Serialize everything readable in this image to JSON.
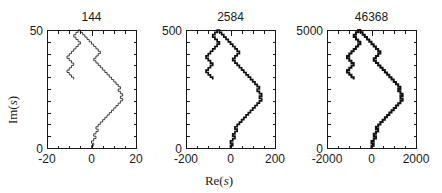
{
  "figure": {
    "background_color": "#ffffff",
    "ink_color": "#1a1a1a",
    "line_color": "#111111",
    "xlabel_main": "Re(",
    "xlabel_var": "s",
    "xlabel_close": ")",
    "ylabel_main": "Im(",
    "ylabel_var": "s",
    "ylabel_close": ")"
  },
  "chart_data": {
    "type": "line",
    "title": "",
    "xlabel": "Re(s)",
    "ylabel": "Im(s)",
    "grid": false,
    "legend": "none",
    "panels": [
      {
        "title": "144",
        "n_steps": 144,
        "xlim": [
          -20,
          20
        ],
        "ylim": [
          0,
          50
        ],
        "xticks": [
          -20,
          0,
          20
        ],
        "xticklabels": [
          "-20",
          "0",
          "20"
        ],
        "yticks": [
          0,
          50
        ],
        "yticklabels": [
          "0",
          "50"
        ],
        "x_minor_tick_count": 8,
        "y_minor_tick_count": 10,
        "line_width": 0.8,
        "walk": {
          "x": [
            0,
            0,
            1,
            1,
            0,
            0,
            1,
            1,
            2,
            2,
            1,
            1,
            2,
            2,
            3,
            3,
            2,
            2,
            3,
            3,
            4,
            4,
            5,
            5,
            6,
            6,
            7,
            7,
            8,
            8,
            9,
            9,
            10,
            10,
            11,
            11,
            12,
            12,
            13,
            13,
            14,
            14,
            13,
            13,
            14,
            14,
            13,
            13,
            12,
            12,
            13,
            13,
            12,
            12,
            11,
            11,
            10,
            10,
            9,
            9,
            8,
            8,
            7,
            7,
            6,
            6,
            5,
            5,
            4,
            4,
            3,
            3,
            2,
            2,
            1,
            1,
            2,
            2,
            3,
            3,
            4,
            4,
            3,
            3,
            2,
            2,
            1,
            1,
            0,
            0,
            -1,
            -1,
            -2,
            -2,
            -3,
            -3,
            -4,
            -4,
            -5,
            -5,
            -6,
            -6,
            -7,
            -7,
            -8,
            -8,
            -7,
            -7,
            -6,
            -6,
            -5,
            -5,
            -6,
            -6,
            -7,
            -7,
            -8,
            -8,
            -9,
            -9,
            -10,
            -10,
            -11,
            -11,
            -10,
            -10,
            -9,
            -9,
            -8,
            -8,
            -9,
            -9,
            -10,
            -10,
            -11,
            -11,
            -10,
            -10,
            -9,
            -9,
            -8,
            -8,
            -7,
            -7,
            -6,
            -6
          ],
          "y": [
            0,
            1,
            1,
            2,
            2,
            3,
            3,
            4,
            4,
            5,
            5,
            6,
            6,
            7,
            7,
            8,
            8,
            9,
            9,
            10,
            10,
            11,
            11,
            12,
            12,
            13,
            13,
            14,
            14,
            15,
            15,
            16,
            16,
            17,
            17,
            18,
            18,
            19,
            19,
            20,
            20,
            21,
            21,
            22,
            22,
            23,
            23,
            24,
            24,
            25,
            25,
            26,
            26,
            27,
            27,
            28,
            28,
            29,
            29,
            30,
            30,
            31,
            31,
            32,
            32,
            33,
            33,
            34,
            34,
            35,
            35,
            36,
            36,
            37,
            37,
            38,
            38,
            39,
            39,
            40,
            40,
            41,
            41,
            42,
            42,
            43,
            43,
            44,
            44,
            45,
            45,
            46,
            46,
            47,
            47,
            48,
            48,
            49,
            49,
            50,
            50,
            49,
            49,
            48,
            48,
            47,
            47,
            46,
            46,
            45,
            45,
            44,
            44,
            43,
            43,
            42,
            42,
            41,
            41,
            40,
            40,
            39,
            39,
            38,
            38,
            37,
            37,
            36,
            36,
            35,
            35,
            34,
            34,
            33,
            33,
            32,
            32,
            31,
            31,
            30,
            30,
            29
          ]
        }
      },
      {
        "title": "2584",
        "n_steps": 2584,
        "xlim": [
          -200,
          200
        ],
        "ylim": [
          0,
          500
        ],
        "xticks": [
          -200,
          0,
          200
        ],
        "xticklabels": [
          "-200",
          "0",
          "200"
        ],
        "yticks": [
          0,
          500
        ],
        "yticklabels": [
          "0",
          "500"
        ],
        "x_minor_tick_count": 8,
        "y_minor_tick_count": 10,
        "line_width": 1.7,
        "scale_from_panel": 0,
        "coordinate_scale": 10
      },
      {
        "title": "46368",
        "n_steps": 46368,
        "xlim": [
          -2000,
          2000
        ],
        "ylim": [
          0,
          5000
        ],
        "xticks": [
          -2000,
          0,
          2000
        ],
        "xticklabels": [
          "-2000",
          "0",
          "2000"
        ],
        "yticks": [
          0,
          5000
        ],
        "yticklabels": [
          "0",
          "5000"
        ],
        "x_minor_tick_count": 8,
        "y_minor_tick_count": 10,
        "line_width": 2.0,
        "scale_from_panel": 0,
        "coordinate_scale": 100
      }
    ]
  }
}
